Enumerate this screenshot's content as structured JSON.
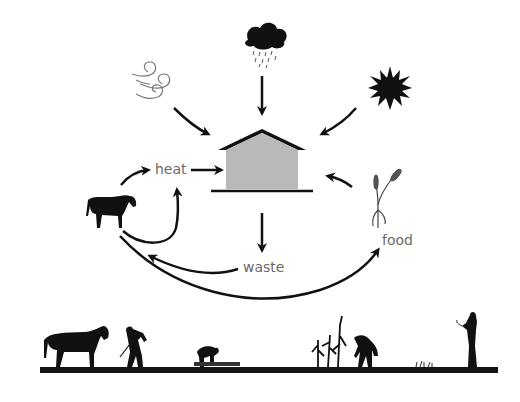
{
  "diagram": {
    "title": "",
    "center_node": {
      "name": "barn",
      "fill": "#b9b9b9"
    },
    "inputs_to_barn": [
      "wind",
      "rain",
      "sun",
      "heat",
      "food"
    ],
    "labels": {
      "heat": "heat",
      "waste": "waste",
      "food": "food"
    },
    "nodes": [
      {
        "id": "wind",
        "icon": "wind-icon"
      },
      {
        "id": "rain",
        "icon": "rain-cloud-icon"
      },
      {
        "id": "sun",
        "icon": "sun-icon"
      },
      {
        "id": "barn",
        "icon": "barn-icon"
      },
      {
        "id": "horse",
        "icon": "horse-icon"
      },
      {
        "id": "heat",
        "label": "heat"
      },
      {
        "id": "wheat",
        "icon": "wheat-icon"
      },
      {
        "id": "food",
        "label": "food"
      },
      {
        "id": "waste",
        "label": "waste"
      }
    ],
    "edges": [
      {
        "from": "wind",
        "to": "barn"
      },
      {
        "from": "rain",
        "to": "barn"
      },
      {
        "from": "sun",
        "to": "barn"
      },
      {
        "from": "heat",
        "to": "barn"
      },
      {
        "from": "wheat",
        "to": "barn"
      },
      {
        "from": "horse",
        "to": "heat"
      },
      {
        "from": "horse",
        "to": "heat",
        "curve": "lower"
      },
      {
        "from": "barn",
        "to": "waste"
      },
      {
        "from": "waste",
        "to": "horse"
      },
      {
        "from": "horse",
        "to": "food"
      }
    ],
    "ground_scene": [
      "horse",
      "man-hoeing",
      "person-planting",
      "corn-stalks",
      "person-harvesting",
      "small-plants",
      "woman-with-scythe"
    ],
    "colors": {
      "ink": "#111111",
      "label": "#6a6a6a",
      "barn_fill": "#b9b9b9",
      "ground": "#141414"
    }
  }
}
